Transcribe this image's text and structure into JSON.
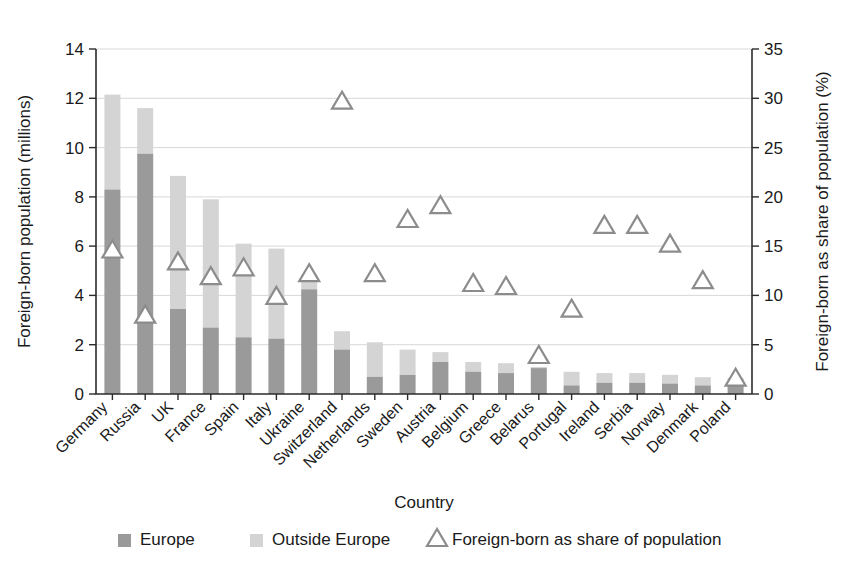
{
  "chart_data": {
    "type": "bar",
    "title": "",
    "xlabel": "Country",
    "ylabel": "Foreign-born population  (millions)",
    "y2label": "Foreign-born as share of population (%)",
    "ylim": [
      0,
      14
    ],
    "y2lim": [
      0,
      35
    ],
    "ytick_step": 2,
    "y2tick_step": 5,
    "yticks": [
      "0",
      "2",
      "4",
      "6",
      "8",
      "10",
      "12",
      "14"
    ],
    "y2ticks": [
      "0",
      "5",
      "10",
      "15",
      "20",
      "25",
      "30",
      "35"
    ],
    "grid": true,
    "legend_position": "bottom",
    "stacked": true,
    "categories": [
      "Germany",
      "Russia",
      "UK",
      "France",
      "Spain",
      "Italy",
      "Ukraine",
      "Switzerland",
      "Netherlands",
      "Sweden",
      "Austria",
      "Belgium",
      "Greece",
      "Belarus",
      "Portugal",
      "Ireland",
      "Serbia",
      "Norway",
      "Denmark",
      "Poland"
    ],
    "series": [
      {
        "name": "Europe",
        "color": "#9a9a9a",
        "values": [
          8.3,
          9.75,
          3.45,
          2.7,
          2.3,
          2.25,
          4.25,
          1.8,
          0.7,
          0.78,
          1.3,
          0.9,
          0.85,
          1.05,
          0.35,
          0.45,
          0.45,
          0.42,
          0.35,
          0.4
        ]
      },
      {
        "name": "Outside Europe",
        "color": "#d4d4d4",
        "values": [
          3.85,
          1.85,
          5.4,
          5.2,
          3.8,
          3.65,
          0.6,
          0.75,
          1.4,
          1.02,
          0.4,
          0.4,
          0.4,
          0.05,
          0.55,
          0.4,
          0.4,
          0.36,
          0.33,
          0.25
        ]
      }
    ],
    "totals": [
      12.15,
      11.6,
      8.85,
      7.9,
      6.1,
      5.9,
      4.85,
      2.55,
      2.1,
      1.8,
      1.7,
      1.3,
      1.25,
      1.1,
      0.9,
      0.85,
      0.85,
      0.78,
      0.68,
      0.65
    ],
    "marker_series": {
      "name": "Foreign-born as share of population",
      "axis": "right",
      "color": "#8c8c8c",
      "values": [
        14.5,
        7.9,
        13.3,
        11.8,
        12.7,
        9.8,
        12.1,
        29.6,
        12.1,
        17.6,
        19.0,
        11.1,
        10.8,
        3.8,
        8.5,
        17.0,
        17.0,
        15.1,
        11.4,
        1.5
      ]
    }
  },
  "legend": {
    "items": [
      {
        "label": "Europe",
        "type": "swatch",
        "color": "#9a9a9a"
      },
      {
        "label": "Outside Europe",
        "type": "swatch",
        "color": "#d4d4d4"
      },
      {
        "label": "Foreign-born as share of population",
        "type": "triangle",
        "color": "#8c8c8c"
      }
    ]
  }
}
